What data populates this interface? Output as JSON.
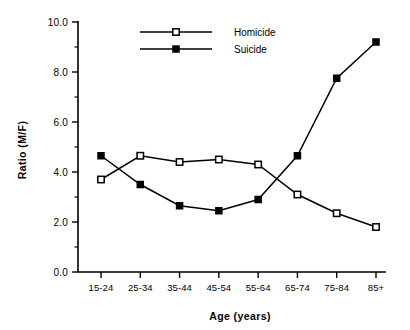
{
  "chart_data": {
    "type": "line",
    "title": "",
    "xlabel": "Age   (years)",
    "ylabel": "Ratio   (M/F)",
    "categories": [
      "15-24",
      "25-34",
      "35-44",
      "45-54",
      "55-64",
      "65-74",
      "75-84",
      "85+"
    ],
    "series": [
      {
        "name": "Homicide",
        "marker": "open-square",
        "values": [
          3.7,
          4.65,
          4.4,
          4.5,
          4.3,
          3.1,
          2.35,
          1.8
        ]
      },
      {
        "name": "Suicide",
        "marker": "filled-square",
        "values": [
          4.65,
          3.5,
          2.65,
          2.45,
          2.9,
          4.65,
          7.75,
          9.2
        ]
      }
    ],
    "ylim": [
      0.0,
      10.0
    ],
    "ytick_labels": [
      "0.0",
      "2.0",
      "4.0",
      "6.0",
      "8.0",
      "10.0"
    ],
    "ytick_values": [
      0.0,
      2.0,
      4.0,
      6.0,
      8.0,
      10.0
    ],
    "yminor_tick_values": [
      1.0,
      3.0,
      5.0,
      7.0,
      9.0
    ],
    "grid": false,
    "legend_position": "top-center",
    "legend_entries": [
      "Homicide",
      "Suicide"
    ],
    "colors": {
      "line": "#000000",
      "open_marker_fill": "#ffffff",
      "closed_marker_fill": "#000000",
      "background": "#ffffff"
    }
  }
}
